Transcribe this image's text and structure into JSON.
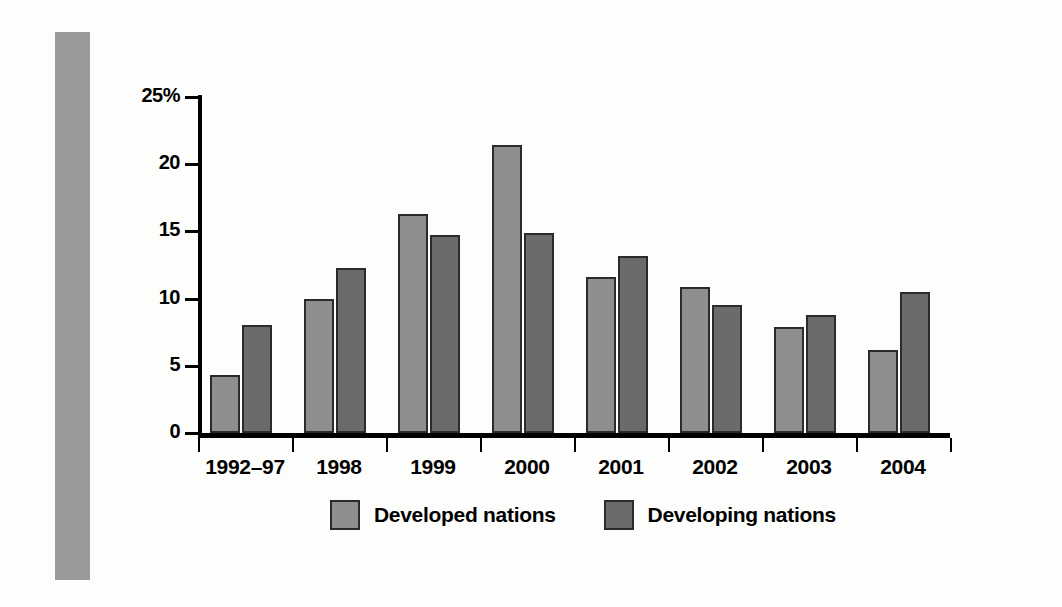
{
  "chart_data": {
    "type": "bar",
    "title": "",
    "xlabel": "",
    "ylabel": "",
    "ylim": [
      0,
      25
    ],
    "yticks": [
      0,
      5,
      10,
      15,
      20,
      25
    ],
    "ytick_labels": [
      "0",
      "5",
      "10",
      "15",
      "20",
      "25%"
    ],
    "grid": false,
    "legend_position": "bottom",
    "categories": [
      "1992–97",
      "1998",
      "1999",
      "2000",
      "2001",
      "2002",
      "2003",
      "2004"
    ],
    "series": [
      {
        "name": "Developed nations",
        "color": "#8e8e8e",
        "values": [
          4.3,
          10.0,
          16.3,
          21.4,
          11.6,
          10.9,
          7.9,
          6.2
        ]
      },
      {
        "name": "Developing nations",
        "color": "#6b6b6b",
        "values": [
          8.0,
          12.3,
          14.7,
          14.9,
          13.2,
          9.5,
          8.8,
          10.5
        ]
      }
    ]
  },
  "colors": {
    "bar_light": "#8e8e8e",
    "bar_dark": "#6b6b6b",
    "bar_outline": "#2b2b2b",
    "axis": "#000000",
    "side_bar": "#9a9a9a",
    "background": "#fdfdfc"
  }
}
